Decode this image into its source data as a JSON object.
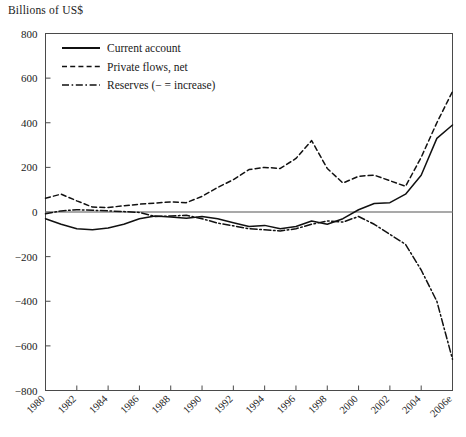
{
  "chart_data": {
    "type": "line",
    "title": "Billions of US$",
    "xlabel": "",
    "ylabel": "Billions of US$",
    "ylim": [
      -800,
      800
    ],
    "ytick_step": 200,
    "yticks": [
      800,
      600,
      400,
      200,
      0,
      -200,
      -400,
      -600,
      -800
    ],
    "ytick_labels": [
      "800",
      "600",
      "400",
      "200",
      "0",
      "−200",
      "−400",
      "−600",
      "−800"
    ],
    "grid": false,
    "zero_line": true,
    "legend_position": "top-left",
    "xlim": [
      1980,
      2006
    ],
    "x": [
      1980,
      1981,
      1982,
      1983,
      1984,
      1985,
      1986,
      1987,
      1988,
      1989,
      1990,
      1991,
      1992,
      1993,
      1994,
      1995,
      1996,
      1997,
      1998,
      1999,
      2000,
      2001,
      2002,
      2003,
      2004,
      2005,
      2006
    ],
    "xtick_values": [
      1980,
      1982,
      1984,
      1986,
      1988,
      1990,
      1992,
      1994,
      1996,
      1998,
      2000,
      2002,
      2004,
      2006
    ],
    "xtick_labels": [
      "1980",
      "1982",
      "1984",
      "1986",
      "1988",
      "1990",
      "1992",
      "1994",
      "1996",
      "1998",
      "2000",
      "2002",
      "2004",
      "2006e"
    ],
    "series": [
      {
        "name": "Current account",
        "style": "solid",
        "color": "#111111",
        "values": [
          -30,
          -55,
          -75,
          -80,
          -72,
          -55,
          -30,
          -18,
          -22,
          -28,
          -20,
          -30,
          -48,
          -65,
          -60,
          -75,
          -65,
          -40,
          -55,
          -30,
          10,
          38,
          42,
          80,
          165,
          330,
          390
        ]
      },
      {
        "name": "Private flows, net",
        "style": "dashed",
        "color": "#111111",
        "values": [
          62,
          80,
          50,
          22,
          20,
          28,
          35,
          40,
          45,
          42,
          70,
          110,
          145,
          190,
          200,
          195,
          240,
          320,
          195,
          130,
          160,
          165,
          140,
          115,
          245,
          400,
          540
        ]
      },
      {
        "name": "Reserves (− = increase)",
        "style": "dashdot",
        "color": "#111111",
        "values": [
          -8,
          5,
          10,
          8,
          5,
          2,
          -2,
          -20,
          -18,
          -15,
          -30,
          -50,
          -62,
          -75,
          -80,
          -85,
          -75,
          -55,
          -40,
          -45,
          -20,
          -55,
          -100,
          -145,
          -260,
          -400,
          -660
        ]
      }
    ],
    "legend": [
      {
        "label": "Current account",
        "style": "solid"
      },
      {
        "label": "Private flows, net",
        "style": "dashed"
      },
      {
        "label": "Reserves (− = increase)",
        "style": "dashdot"
      }
    ]
  },
  "axis_title": "Billions of US$"
}
